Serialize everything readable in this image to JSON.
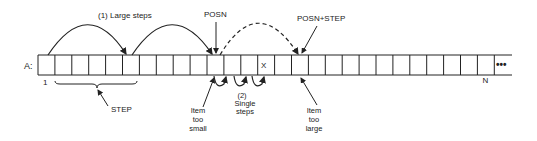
{
  "diagram": {
    "array_label": "A:",
    "first_index_label": "1",
    "last_index_label": "N",
    "ellipsis": "•••",
    "target_item": "X",
    "large_steps_label": "(1) Large steps",
    "posn_label": "POSN",
    "posn_step_label": "POSN+STEP",
    "step_label": "STEP",
    "item_too_small": [
      "Item",
      "too",
      "small"
    ],
    "single_steps": [
      "(2)",
      "Single",
      "steps"
    ],
    "item_too_large": [
      "Item",
      "too",
      "large"
    ],
    "cell_count": 27,
    "colors": {
      "line": "#222222",
      "background": "#ffffff"
    }
  }
}
